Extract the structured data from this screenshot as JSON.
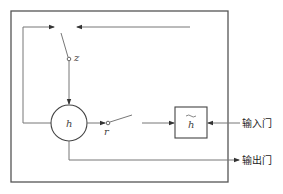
{
  "diagram": {
    "type": "GRU gated recurrent unit schematic",
    "nodes": {
      "hidden_state": {
        "label": "h",
        "shape": "circle"
      },
      "candidate_state": {
        "label": "h",
        "decoration": "tilde",
        "shape": "square"
      },
      "update_gate_switch": {
        "label": "z"
      },
      "reset_gate_switch": {
        "label": "r"
      }
    },
    "ports": {
      "input_gate": {
        "label": "输入门"
      },
      "output_gate": {
        "label": "输出门"
      }
    },
    "colors": {
      "line": "#777777",
      "frame": "#555555",
      "text": "#222222"
    }
  }
}
